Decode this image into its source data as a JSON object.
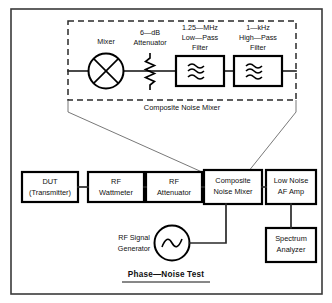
{
  "diagram": {
    "title": "Phase—Noise Test",
    "group_caption": "Composite Noise Mixer",
    "inner_components": [
      {
        "name": "mixer",
        "label": "Mixer",
        "symbol": "mixer-circle-x-icon"
      },
      {
        "name": "attenuator",
        "label_line1": "6—dB",
        "label_line2": "Attenuator",
        "symbol": "resistor-zigzag-icon"
      },
      {
        "name": "low-pass-filter",
        "label_line1": "1.25—MHz",
        "label_line2": "Low—Pass",
        "label_line3": "Filter",
        "symbol": "wave-filter-icon"
      },
      {
        "name": "high-pass-filter",
        "label_line1": "1—kHz",
        "label_line2": "High—Pass",
        "label_line3": "Filter",
        "symbol": "wave-filter-icon"
      }
    ],
    "chain_blocks": [
      {
        "name": "dut",
        "line1": "DUT",
        "line2": "(Transmitter)"
      },
      {
        "name": "rf-wattmeter",
        "line1": "RF",
        "line2": "Wattmeter"
      },
      {
        "name": "rf-attenuator",
        "line1": "RF",
        "line2": "Attenuator"
      },
      {
        "name": "composite-noise-mixer",
        "line1": "Composite",
        "line2": "Noise Mixer"
      },
      {
        "name": "low-noise-af-amp",
        "line1": "Low Noise",
        "line2": "AF Amp"
      }
    ],
    "source": {
      "name": "rf-signal-generator",
      "line1": "RF Signal",
      "line2": "Generator",
      "symbol": "sine-source-icon"
    },
    "instrument": {
      "name": "spectrum-analyzer",
      "line1": "Spectrum",
      "line2": "Analyzer"
    },
    "colors": {
      "ink": "#000000",
      "wire": "#2a2a2a",
      "frame": "#3a3a3a",
      "leader": "#555555",
      "paper": "#ffffff"
    }
  }
}
